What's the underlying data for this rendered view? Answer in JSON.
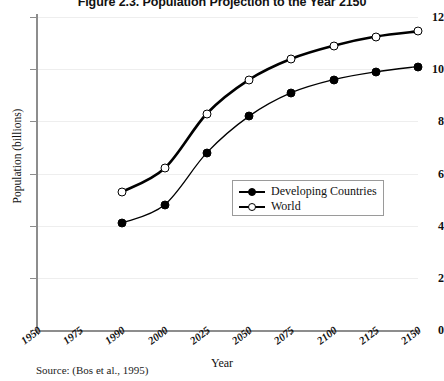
{
  "chart_data": {
    "type": "line",
    "title": "Figure 2.3. Population Projection to the Year 2150",
    "xlabel": "Year",
    "ylabel": "Population (billions)",
    "source_note": "Source: (Bos et al., 1995)",
    "categories": [
      "1950",
      "1975",
      "1990",
      "2000",
      "2025",
      "2050",
      "2075",
      "2100",
      "2125",
      "2150"
    ],
    "x_tick_labels": [
      "1950",
      "1975",
      "1990",
      "2000",
      "2025",
      "2050",
      "2075",
      "2100",
      "2125",
      "2150"
    ],
    "y_tick_labels": [
      "0",
      "2",
      "4",
      "6",
      "8",
      "10",
      "12"
    ],
    "y_ticks": [
      0,
      2,
      4,
      6,
      8,
      10,
      12
    ],
    "ylim": [
      0,
      12
    ],
    "grid": "horizontal",
    "legend_position": "center-right-inside",
    "series": [
      {
        "name": "Developing Countries",
        "marker": "filled-circle",
        "color": "#000000",
        "x": [
          "1990",
          "2000",
          "2025",
          "2050",
          "2075",
          "2100",
          "2125",
          "2150"
        ],
        "values": [
          4.1,
          4.8,
          6.8,
          8.2,
          9.1,
          9.6,
          9.9,
          10.1
        ]
      },
      {
        "name": "World",
        "marker": "open-circle",
        "color": "#000000",
        "x": [
          "1990",
          "2000",
          "2025",
          "2050",
          "2075",
          "2100",
          "2125",
          "2150"
        ],
        "values": [
          5.3,
          6.2,
          8.3,
          9.6,
          10.4,
          10.9,
          11.25,
          11.45
        ]
      }
    ]
  },
  "legend": {
    "items": [
      {
        "label": "Developing Countries",
        "marker": "filled-circle"
      },
      {
        "label": "World",
        "marker": "open-circle"
      }
    ]
  }
}
